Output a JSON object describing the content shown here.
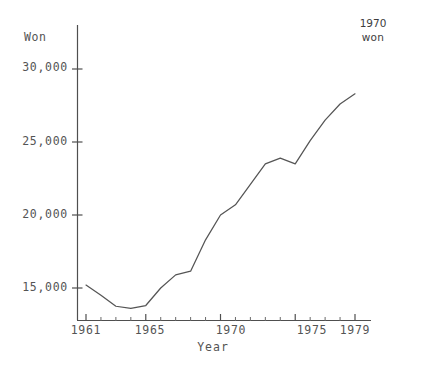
{
  "chart_data": {
    "type": "line",
    "title": "",
    "xlabel": "Year",
    "ylabel": "Won",
    "unit_note_year": "1970",
    "unit_note_currency": "won",
    "xlim": [
      1961,
      1979
    ],
    "ylim": [
      13200,
      30800
    ],
    "grid": false,
    "legend": "none",
    "y_ticks": [
      15000,
      20000,
      25000,
      30000
    ],
    "y_tick_labels": [
      "15,000",
      "20,000",
      "25,000",
      "30,000"
    ],
    "x_ticks": [
      1961,
      1965,
      1970,
      1975,
      1979
    ],
    "x_tick_labels": [
      "1961",
      "1965",
      "1970",
      "1975",
      "1979"
    ],
    "x_minor_ticks": [
      1962,
      1963,
      1964,
      1966,
      1967,
      1968,
      1969,
      1971,
      1972,
      1973,
      1974,
      1976,
      1977,
      1978
    ],
    "x": [
      1961,
      1962,
      1963,
      1964,
      1965,
      1966,
      1967,
      1968,
      1969,
      1970,
      1971,
      1972,
      1973,
      1974,
      1975,
      1976,
      1977,
      1978,
      1979
    ],
    "values": [
      15200,
      14500,
      13750,
      13600,
      13800,
      15000,
      15900,
      16150,
      18300,
      20000,
      20700,
      22100,
      23500,
      23900,
      23500,
      25100,
      26500,
      27600,
      28300
    ],
    "series": [
      {
        "name": "Won",
        "values": [
          15200,
          14500,
          13750,
          13600,
          13800,
          15000,
          15900,
          16150,
          18300,
          20000,
          20700,
          22100,
          23500,
          23900,
          23500,
          25100,
          26500,
          27600,
          28300
        ]
      }
    ],
    "line_color": "#555555",
    "background_color": "#ffffff"
  }
}
